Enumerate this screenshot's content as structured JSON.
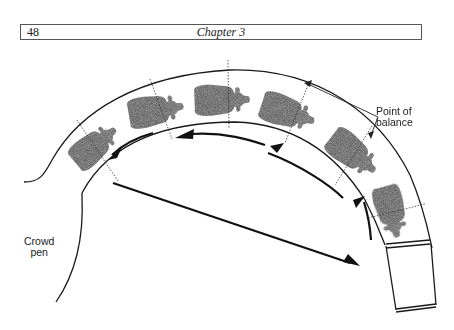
{
  "header": {
    "page_number": "48",
    "chapter_title": "Chapter 3"
  },
  "figure": {
    "labels": {
      "point_of_balance_line1": "Point of",
      "point_of_balance_line2": "balance",
      "crowd_pen_line1": "Crowd",
      "crowd_pen_line2": "pen"
    },
    "animal_count": 6,
    "colors": {
      "ink": "#1a1a1a",
      "animal_fill": "#4a4a4a"
    }
  }
}
